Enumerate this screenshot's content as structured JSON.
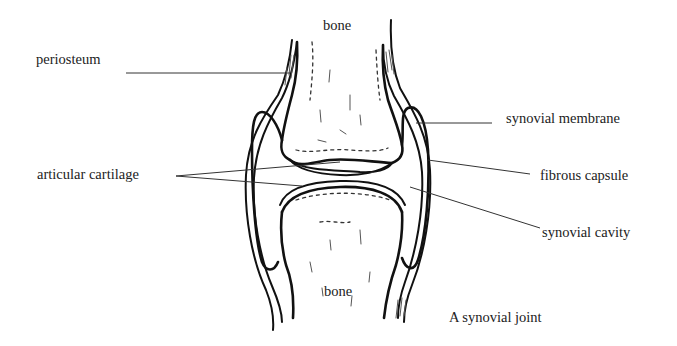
{
  "diagram": {
    "title": "A synovial joint",
    "labels": {
      "bone_top": "bone",
      "bone_bottom": "bone",
      "periosteum": "periosteum",
      "articular_cartilage": "articular cartilage",
      "synovial_membrane": "synovial membrane",
      "fibrous_capsule": "fibrous capsule",
      "synovial_cavity": "synovial cavity"
    },
    "colors": {
      "background": "#ffffff",
      "ink": "#111111",
      "text": "#222222"
    }
  }
}
